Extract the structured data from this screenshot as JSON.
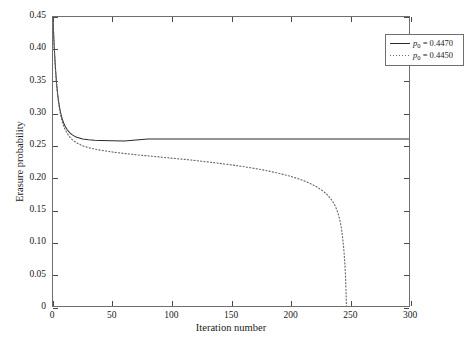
{
  "chart_data": {
    "type": "line",
    "title": "",
    "xlabel": "Iteration number",
    "ylabel": "Erasure probability",
    "xlim": [
      0,
      300
    ],
    "ylim": [
      0,
      0.45
    ],
    "xticks": [
      0,
      50,
      100,
      150,
      200,
      250,
      300
    ],
    "xtick_labels": [
      "0",
      "50",
      "100",
      "150",
      "200",
      "250",
      "300"
    ],
    "yticks": [
      0,
      0.05,
      0.1,
      0.15,
      0.2,
      0.25,
      0.3,
      0.35,
      0.4,
      0.45
    ],
    "ytick_labels": [
      "0",
      "0.05",
      "0.10",
      "0.15",
      "0.20",
      "0.25",
      "0.30",
      "0.35",
      "0.40",
      "0.45"
    ],
    "grid": false,
    "legend_position": "top-right",
    "series": [
      {
        "name": "p_0 = 0.4470",
        "label_prefix": "p",
        "label_sub": "0",
        "label_value": " = 0.4470",
        "style": "solid",
        "color": "#2b2b2b",
        "points": [
          [
            0,
            0.447
          ],
          [
            1,
            0.405
          ],
          [
            2,
            0.372
          ],
          [
            3,
            0.347
          ],
          [
            4,
            0.329
          ],
          [
            5,
            0.315
          ],
          [
            6,
            0.3045
          ],
          [
            7,
            0.2965
          ],
          [
            8,
            0.29
          ],
          [
            9,
            0.285
          ],
          [
            10,
            0.2808
          ],
          [
            12,
            0.2745
          ],
          [
            14,
            0.27
          ],
          [
            16,
            0.2668
          ],
          [
            18,
            0.2645
          ],
          [
            20,
            0.2628
          ],
          [
            25,
            0.2602
          ],
          [
            30,
            0.2588
          ],
          [
            35,
            0.258
          ],
          [
            40,
            0.2576
          ],
          [
            50,
            0.2572
          ],
          [
            60,
            0.257
          ],
          [
            80,
            0.26
          ],
          [
            100,
            0.26
          ],
          [
            150,
            0.26
          ],
          [
            200,
            0.26
          ],
          [
            250,
            0.26
          ],
          [
            300,
            0.26
          ]
        ]
      },
      {
        "name": "p_0 = 0.4450",
        "label_prefix": "p",
        "label_sub": "0",
        "label_value": " = 0.4450",
        "style": "dotted",
        "color": "#6a6a6a",
        "points": [
          [
            0,
            0.445
          ],
          [
            1,
            0.403
          ],
          [
            2,
            0.37
          ],
          [
            3,
            0.345
          ],
          [
            4,
            0.3265
          ],
          [
            5,
            0.312
          ],
          [
            6,
            0.301
          ],
          [
            7,
            0.2925
          ],
          [
            8,
            0.2855
          ],
          [
            9,
            0.28
          ],
          [
            10,
            0.2755
          ],
          [
            12,
            0.2685
          ],
          [
            14,
            0.2635
          ],
          [
            16,
            0.2595
          ],
          [
            18,
            0.2565
          ],
          [
            20,
            0.254
          ],
          [
            25,
            0.2495
          ],
          [
            30,
            0.2465
          ],
          [
            40,
            0.2425
          ],
          [
            50,
            0.2398
          ],
          [
            60,
            0.2375
          ],
          [
            70,
            0.2355
          ],
          [
            80,
            0.2338
          ],
          [
            90,
            0.232
          ],
          [
            100,
            0.2302
          ],
          [
            110,
            0.2285
          ],
          [
            120,
            0.2265
          ],
          [
            130,
            0.2245
          ],
          [
            140,
            0.2222
          ],
          [
            150,
            0.2198
          ],
          [
            160,
            0.2172
          ],
          [
            170,
            0.2142
          ],
          [
            180,
            0.2108
          ],
          [
            190,
            0.2068
          ],
          [
            200,
            0.202
          ],
          [
            205,
            0.1992
          ],
          [
            210,
            0.196
          ],
          [
            215,
            0.1922
          ],
          [
            220,
            0.1878
          ],
          [
            225,
            0.1822
          ],
          [
            228,
            0.1782
          ],
          [
            231,
            0.1735
          ],
          [
            234,
            0.1672
          ],
          [
            236,
            0.162
          ],
          [
            238,
            0.1552
          ],
          [
            240,
            0.1455
          ],
          [
            241,
            0.139
          ],
          [
            242,
            0.1312
          ],
          [
            243,
            0.1212
          ],
          [
            244,
            0.108
          ],
          [
            245,
            0.09
          ],
          [
            246,
            0.065
          ],
          [
            246.6,
            0.042
          ],
          [
            247,
            0.018
          ],
          [
            247.3,
            0.0
          ]
        ]
      }
    ]
  },
  "axes": {
    "x_title": "Iteration number",
    "y_title": "Erasure probability"
  }
}
